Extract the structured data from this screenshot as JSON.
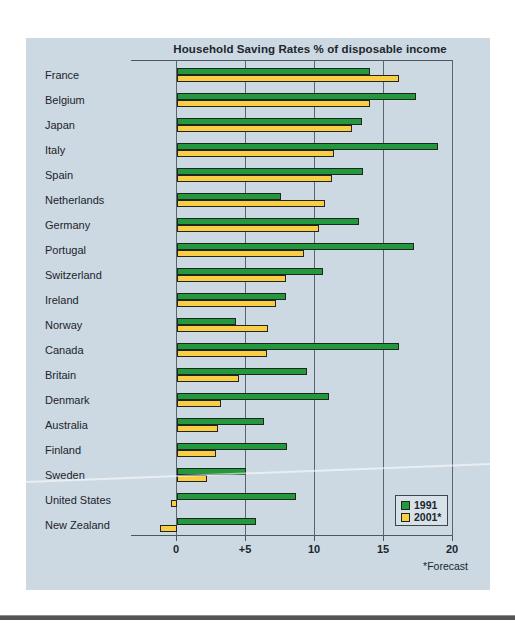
{
  "title": "Household Saving Rates % of disposable income",
  "forecast_note": "*Forecast",
  "colors": {
    "panel_background": "#ccd9e3",
    "series_1991": "#21993c",
    "series_2001": "#f9ce44",
    "bar_outline": "#20261f",
    "axis_line": "#4d565e",
    "text": "#20262c"
  },
  "chart_data": {
    "type": "bar",
    "orientation": "horizontal",
    "title": "Household Saving Rates % of disposable income",
    "xlabel": "",
    "ylabel": "",
    "x_range": [
      0,
      20
    ],
    "grid": true,
    "categories": [
      "France",
      "Belgium",
      "Japan",
      "Italy",
      "Spain",
      "Netherlands",
      "Germany",
      "Portugal",
      "Switzerland",
      "Ireland",
      "Norway",
      "Canada",
      "Britain",
      "Denmark",
      "Australia",
      "Finland",
      "Sweden",
      "United States",
      "New Zealand"
    ],
    "series": [
      {
        "name": "1991",
        "color": "#21993c",
        "values": [
          14.0,
          17.3,
          13.4,
          18.9,
          13.5,
          7.5,
          13.2,
          17.2,
          10.6,
          7.9,
          4.3,
          16.1,
          9.4,
          11.0,
          6.3,
          8.0,
          5.0,
          8.6,
          5.7
        ]
      },
      {
        "name": "2001*",
        "color": "#f9ce44",
        "values": [
          16.1,
          14.0,
          12.7,
          11.4,
          11.2,
          10.7,
          10.3,
          9.2,
          7.9,
          7.2,
          6.6,
          6.5,
          4.5,
          3.2,
          3.0,
          2.8,
          2.2,
          -0.4,
          -1.2
        ]
      }
    ],
    "x_ticks": [
      {
        "label": "0",
        "value": 0
      },
      {
        "label": "+5",
        "value": 5
      },
      {
        "label": "10",
        "value": 10
      },
      {
        "label": "15",
        "value": 15
      },
      {
        "label": "20",
        "value": 20
      }
    ],
    "annotations": [
      "*Forecast"
    ],
    "legend_position": "bottom-right"
  }
}
